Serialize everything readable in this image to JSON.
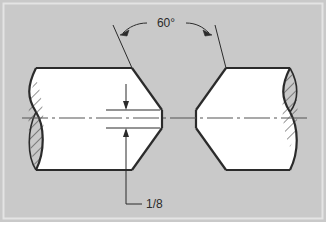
{
  "figure": {
    "panel_background": "#c9c9c9",
    "panel_border_color": "#e4e4e4",
    "page_background": "#ffffff",
    "line_color": "#2b2b2b",
    "metal_fill": "#ffffff",
    "hatch_color": "#3a3a3a",
    "centerline_color": "#555555"
  },
  "annotations": {
    "groove_angle": {
      "label": "60°",
      "name": "included-groove-angle",
      "value": 60,
      "unit": "degrees",
      "leader_style": "curved-with-two-arrowheads"
    },
    "root_opening": {
      "label": "1/8",
      "name": "root-opening-dimension",
      "value": "1/8",
      "unit": "inch",
      "leader_style": "L-shaped-jogged-leader",
      "arrow_style": "opposed-vertical-arrows"
    }
  },
  "geometry": {
    "centerline": {
      "name": "axis-centerline",
      "pattern": "long-dash short-dash",
      "y": 117
    },
    "left_bar": {
      "name": "left-round-bar",
      "section_hatch": "lower-left-lens",
      "bevel": "right-end-v-bevel"
    },
    "right_bar": {
      "name": "right-round-bar",
      "section_hatch": "upper-right-lens",
      "bevel": "left-end-v-bevel"
    }
  }
}
